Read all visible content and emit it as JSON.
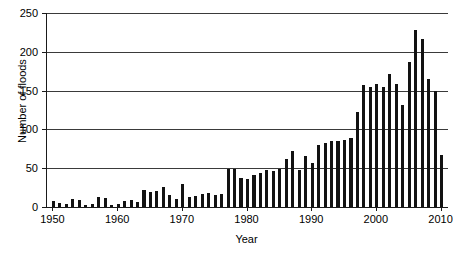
{
  "chart_data": {
    "type": "bar",
    "title": "",
    "xlabel": "Year",
    "ylabel": "Number of floods",
    "xlim": [
      1949,
      2011
    ],
    "ylim": [
      0,
      250
    ],
    "yticks": [
      0,
      50,
      100,
      150,
      200,
      250
    ],
    "xticks": [
      1950,
      1960,
      1970,
      1980,
      1990,
      2000,
      2010
    ],
    "grid": "horizontal",
    "legend": "none",
    "bar_color": "#121212",
    "axis_color": "#1a1a1a",
    "grid_color": "#3a3a3a",
    "categories": [
      1950,
      1951,
      1952,
      1953,
      1954,
      1955,
      1956,
      1957,
      1958,
      1959,
      1960,
      1961,
      1962,
      1963,
      1964,
      1965,
      1966,
      1967,
      1968,
      1969,
      1970,
      1971,
      1972,
      1973,
      1974,
      1975,
      1976,
      1977,
      1978,
      1979,
      1980,
      1981,
      1982,
      1983,
      1984,
      1985,
      1986,
      1987,
      1988,
      1989,
      1990,
      1991,
      1992,
      1993,
      1994,
      1995,
      1996,
      1997,
      1998,
      1999,
      2000,
      2001,
      2002,
      2003,
      2004,
      2005,
      2006,
      2007,
      2008,
      2009,
      2010
    ],
    "values": [
      8,
      5,
      4,
      10,
      9,
      3,
      4,
      13,
      11,
      2,
      4,
      8,
      9,
      7,
      22,
      19,
      21,
      26,
      15,
      10,
      30,
      13,
      14,
      17,
      18,
      16,
      17,
      49,
      49,
      37,
      36,
      41,
      44,
      48,
      46,
      49,
      62,
      72,
      48,
      66,
      57,
      80,
      83,
      85,
      85,
      86,
      89,
      122,
      157,
      155,
      158,
      155,
      172,
      158,
      132,
      187,
      228,
      217,
      165,
      150,
      67
    ]
  }
}
